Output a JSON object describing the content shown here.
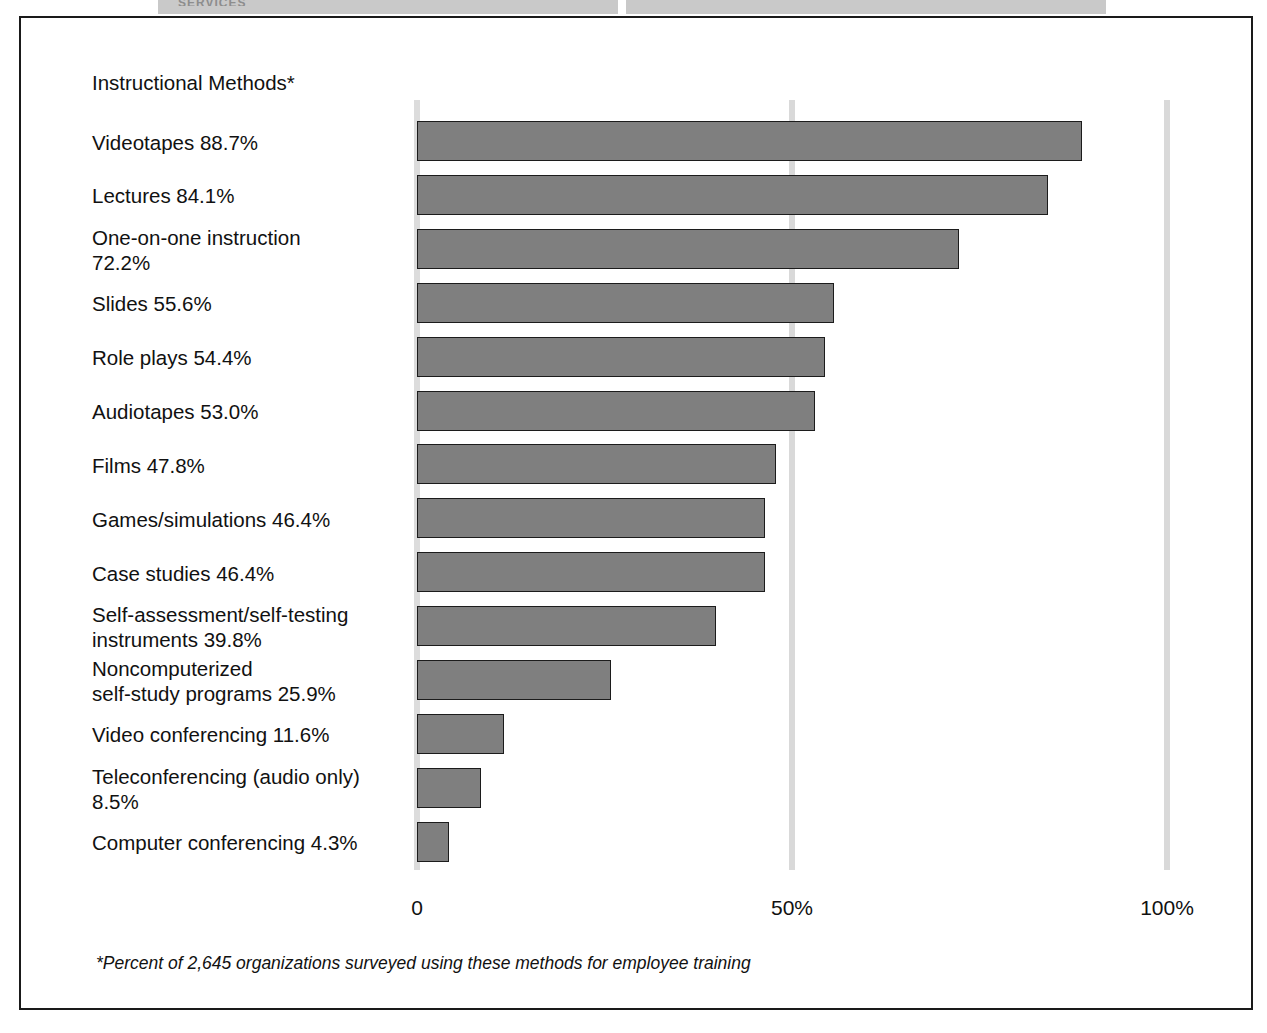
{
  "top_band": {
    "ghost_text": "SERVICES"
  },
  "chart_data": {
    "type": "bar",
    "orientation": "horizontal",
    "title": "Instructional Methods*",
    "xlabel": "",
    "ylabel": "",
    "xlim": [
      0,
      100
    ],
    "grid": true,
    "legend": null,
    "gridlines": [
      {
        "value": 0,
        "label": "0"
      },
      {
        "value": 50,
        "label": "50%"
      },
      {
        "value": 100,
        "label": "100%"
      }
    ],
    "tick_labels": [
      "0",
      "50%",
      "100%"
    ],
    "categories": [
      "Videotapes",
      "Lectures",
      "One-on-one instruction",
      "Slides",
      "Role plays",
      "Audiotapes",
      "Films",
      "Games/simulations",
      "Case studies",
      "Self-assessment/self-testing instruments",
      "Noncomputerized self-study programs",
      "Video conferencing",
      "Teleconferencing (audio only)",
      "Computer conferencing"
    ],
    "values": [
      88.7,
      84.1,
      72.2,
      55.6,
      54.4,
      53.0,
      47.8,
      46.4,
      46.4,
      39.8,
      25.9,
      11.6,
      8.5,
      4.3
    ],
    "bar_labels": [
      "Videotapes 88.7%",
      "Lectures 84.1%",
      "One-on-one instruction\n72.2%",
      "Slides 55.6%",
      "Role plays 54.4%",
      "Audiotapes 53.0%",
      "Films 47.8%",
      "Games/simulations 46.4%",
      "Case studies 46.4%",
      "Self-assessment/self-testing\ninstruments 39.8%",
      "Noncomputerized\nself-study programs 25.9%",
      "Video conferencing 11.6%",
      "Teleconferencing (audio only)\n8.5%",
      "Computer conferencing 4.3%"
    ],
    "bar_fill_color": "#7f7f7f",
    "bar_border_color": "#1c1c1c",
    "gridline_color": "#d9d9d9",
    "annotation": "*Percent of 2,645 organizations surveyed using these methods for employee training"
  },
  "footnote": "*Percent of 2,645 organizations surveyed using these methods for employee training"
}
